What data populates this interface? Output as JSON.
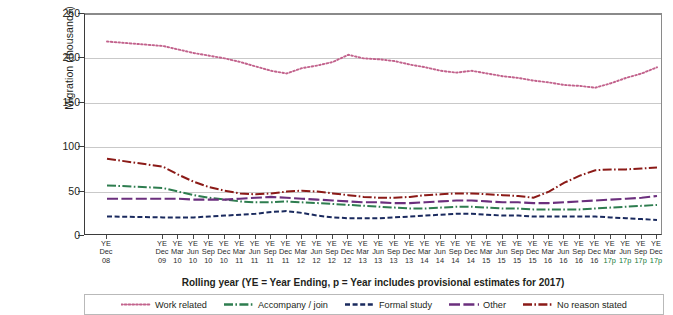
{
  "chart_data": {
    "type": "line",
    "title": "",
    "xlabel": "Rolling year (YE = Year Ending, p = Year includes provisional estimates for 2017)",
    "ylabel": "Migration (thousands)",
    "ylim": [
      0,
      250
    ],
    "yticks": [
      0,
      50,
      100,
      150,
      200,
      250
    ],
    "grid": true,
    "legend_position": "bottom",
    "categories": [
      "YE Dec 08",
      "YE Dec 09",
      "YE Mar 10",
      "YE Jun 10",
      "YE Sep 10",
      "YE Dec 10",
      "YE Mar 11",
      "YE Jun 11",
      "YE Sep 11",
      "YE Dec 11",
      "YE Mar 12",
      "YE Jun 12",
      "YE Sep 12",
      "YE Dec 12",
      "YE Mar 13",
      "YE Jun 13",
      "YE Sep 13",
      "YE Dec 13",
      "YE Mar 14",
      "YE Jun 14",
      "YE Sep 14",
      "YE Dec 14",
      "YE Mar 15",
      "YE Jun 15",
      "YE Sep 15",
      "YE Dec 15",
      "YE Mar 16",
      "YE Jun 16",
      "YE Sep 16",
      "YE Dec 16",
      "YE Mar 17p",
      "YE Jun 17p",
      "YE Sep 17p",
      "YE Dec 17p"
    ],
    "tick_lines": [
      {
        "l1": "YE",
        "l2": "Dec",
        "l3": "08",
        "provisional": false
      },
      {
        "l1": "YE",
        "l2": "Dec",
        "l3": "09",
        "provisional": false
      },
      {
        "l1": "YE",
        "l2": "Mar",
        "l3": "10",
        "provisional": false
      },
      {
        "l1": "YE",
        "l2": "Jun",
        "l3": "10",
        "provisional": false
      },
      {
        "l1": "YE",
        "l2": "Sep",
        "l3": "10",
        "provisional": false
      },
      {
        "l1": "YE",
        "l2": "Dec",
        "l3": "10",
        "provisional": false
      },
      {
        "l1": "YE",
        "l2": "Mar",
        "l3": "11",
        "provisional": false
      },
      {
        "l1": "YE",
        "l2": "Jun",
        "l3": "11",
        "provisional": false
      },
      {
        "l1": "YE",
        "l2": "Sep",
        "l3": "11",
        "provisional": false
      },
      {
        "l1": "YE",
        "l2": "Dec",
        "l3": "11",
        "provisional": false
      },
      {
        "l1": "YE",
        "l2": "Mar",
        "l3": "12",
        "provisional": false
      },
      {
        "l1": "YE",
        "l2": "Jun",
        "l3": "12",
        "provisional": false
      },
      {
        "l1": "YE",
        "l2": "Sep",
        "l3": "12",
        "provisional": false
      },
      {
        "l1": "YE",
        "l2": "Dec",
        "l3": "12",
        "provisional": false
      },
      {
        "l1": "YE",
        "l2": "Mar",
        "l3": "13",
        "provisional": false
      },
      {
        "l1": "YE",
        "l2": "Jun",
        "l3": "13",
        "provisional": false
      },
      {
        "l1": "YE",
        "l2": "Sep",
        "l3": "13",
        "provisional": false
      },
      {
        "l1": "YE",
        "l2": "Dec",
        "l3": "13",
        "provisional": false
      },
      {
        "l1": "YE",
        "l2": "Mar",
        "l3": "14",
        "provisional": false
      },
      {
        "l1": "YE",
        "l2": "Jun",
        "l3": "14",
        "provisional": false
      },
      {
        "l1": "YE",
        "l2": "Sep",
        "l3": "14",
        "provisional": false
      },
      {
        "l1": "YE",
        "l2": "Dec",
        "l3": "14",
        "provisional": false
      },
      {
        "l1": "YE",
        "l2": "Mar",
        "l3": "15",
        "provisional": false
      },
      {
        "l1": "YE",
        "l2": "Jun",
        "l3": "15",
        "provisional": false
      },
      {
        "l1": "YE",
        "l2": "Sep",
        "l3": "15",
        "provisional": false
      },
      {
        "l1": "YE",
        "l2": "Dec",
        "l3": "15",
        "provisional": false
      },
      {
        "l1": "YE",
        "l2": "Mar",
        "l3": "16",
        "provisional": false
      },
      {
        "l1": "YE",
        "l2": "Jun",
        "l3": "16",
        "provisional": false
      },
      {
        "l1": "YE",
        "l2": "Sep",
        "l3": "16",
        "provisional": false
      },
      {
        "l1": "YE",
        "l2": "Dec",
        "l3": "16",
        "provisional": false
      },
      {
        "l1": "YE",
        "l2": "Mar",
        "l3": "17p",
        "provisional": true
      },
      {
        "l1": "YE",
        "l2": "Jun",
        "l3": "17p",
        "provisional": true
      },
      {
        "l1": "YE",
        "l2": "Sep",
        "l3": "17p",
        "provisional": true
      },
      {
        "l1": "YE",
        "l2": "Dec",
        "l3": "17p",
        "provisional": true
      }
    ],
    "series": [
      {
        "name": "Work related",
        "color": "#c2628c",
        "style": "dotted",
        "values": [
          219,
          214,
          210,
          206,
          203,
          200,
          196,
          191,
          186,
          183,
          189,
          192,
          196,
          204,
          200,
          199,
          197,
          193,
          190,
          186,
          184,
          186,
          183,
          180,
          178,
          175,
          173,
          170,
          169,
          167,
          172,
          178,
          183,
          190
        ]
      },
      {
        "name": "Accompany / join",
        "color": "#2e7d4f",
        "style": "dashdot",
        "values": [
          57,
          54,
          50,
          46,
          43,
          41,
          39,
          38,
          38,
          39,
          38,
          37,
          36,
          35,
          34,
          33,
          32,
          31,
          31,
          32,
          33,
          33,
          32,
          31,
          31,
          30,
          30,
          30,
          30,
          31,
          32,
          33,
          34,
          35
        ]
      },
      {
        "name": "Formal study",
        "color": "#1a2a5e",
        "style": "dashed",
        "values": [
          22,
          21,
          21,
          21,
          22,
          23,
          24,
          25,
          27,
          28,
          26,
          23,
          21,
          20,
          20,
          20,
          21,
          22,
          23,
          24,
          25,
          25,
          24,
          23,
          23,
          22,
          22,
          22,
          22,
          22,
          21,
          20,
          19,
          18
        ]
      },
      {
        "name": "Other",
        "color": "#6b2f7d",
        "style": "longdash",
        "values": [
          42,
          42,
          42,
          41,
          41,
          41,
          42,
          43,
          44,
          43,
          42,
          41,
          40,
          39,
          38,
          38,
          37,
          37,
          38,
          39,
          40,
          40,
          39,
          38,
          38,
          37,
          37,
          38,
          39,
          40,
          41,
          42,
          43,
          45
        ]
      },
      {
        "name": "No reason stated",
        "color": "#8b1a17",
        "style": "dashdot",
        "values": [
          87,
          78,
          69,
          61,
          55,
          51,
          48,
          47,
          48,
          50,
          51,
          50,
          48,
          46,
          44,
          43,
          43,
          44,
          46,
          47,
          48,
          48,
          47,
          46,
          45,
          43,
          50,
          60,
          68,
          74,
          75,
          75,
          76,
          77
        ]
      }
    ]
  },
  "legend": {
    "items": [
      {
        "label": "Work related"
      },
      {
        "label": "Accompany / join"
      },
      {
        "label": "Formal study"
      },
      {
        "label": "Other"
      },
      {
        "label": "No reason stated"
      }
    ]
  }
}
